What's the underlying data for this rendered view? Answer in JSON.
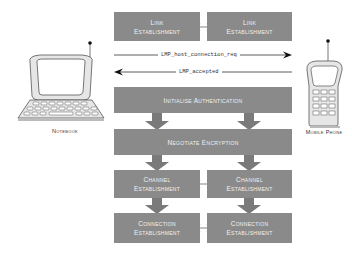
{
  "diagram": {
    "devices": {
      "notebook": {
        "label": "Notebook"
      },
      "mobile_phone": {
        "label": "Mobile Phone"
      }
    },
    "link_establishment": {
      "left": [
        "Link",
        "Establishment"
      ],
      "right": [
        "Link",
        "Establishment"
      ]
    },
    "messages": {
      "request": {
        "label": "LMP_host_connection_req",
        "direction": "right"
      },
      "response": {
        "label": "LMP_accepted",
        "direction": "left"
      }
    },
    "initialise_authentication": {
      "label": "Initialise Authentication"
    },
    "negotiate_encryption": {
      "label": "Negotiate Encryption"
    },
    "channel_establishment": {
      "left": [
        "Channel",
        "Establishment"
      ],
      "right": [
        "Channel",
        "Establishment"
      ]
    },
    "connection_establishment": {
      "left": [
        "Connection",
        "Establishment"
      ],
      "right": [
        "Connection",
        "Establishment"
      ]
    },
    "colors": {
      "box_fill": "#8a8a8a",
      "box_text": "#f2f2f2",
      "arrow_fill": "#7a7a7a",
      "device_fill": "#e6e6e6",
      "device_stroke": "#555555"
    }
  }
}
